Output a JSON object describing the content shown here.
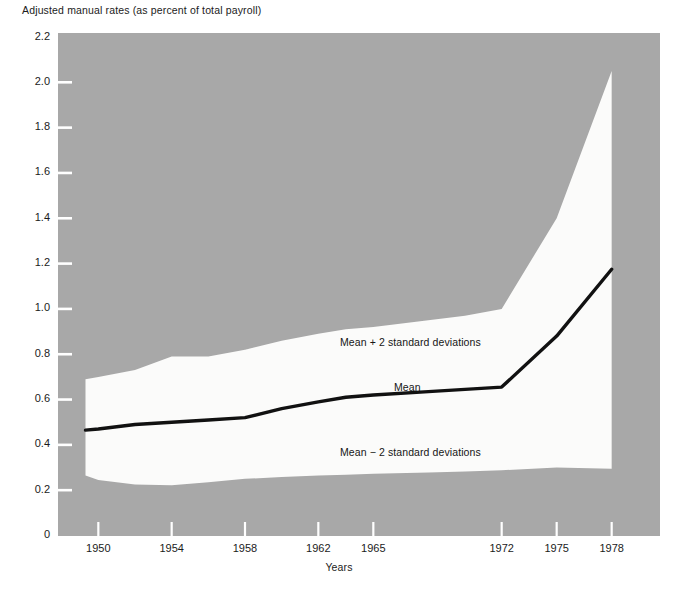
{
  "figure": {
    "title": "Adjusted manual rates (as percent of total payroll)",
    "xaxis_title": "Years",
    "footnote_faint": "",
    "background_color": "#ffffff",
    "band_fill_color": "#fbfbfa",
    "plot_area_color": "#a8a8a8",
    "line_color": "#111111"
  },
  "annotations": {
    "upper": "Mean + 2 standard deviations",
    "mean": "Mean",
    "lower": "Mean − 2 standard deviations"
  },
  "yticks": [
    "2.2",
    "2.0",
    "1.8",
    "1.6",
    "1.4",
    "1.2",
    "1.0",
    "0.8",
    "0.6",
    "0.4",
    "0.2",
    "0"
  ],
  "xticks": [
    "1950",
    "1954",
    "1958",
    "1962",
    "1965",
    "1972",
    "1975",
    "1978"
  ],
  "chart_data": {
    "type": "area",
    "title": "Adjusted manual rates (as percent of total payroll)",
    "xlabel": "Years",
    "ylabel": "Adjusted manual rates (as percent of total payroll)",
    "xlim": [
      1949,
      1979
    ],
    "ylim": [
      0,
      2.2
    ],
    "ytick_values": [
      2.2,
      2.0,
      1.8,
      1.6,
      1.4,
      1.2,
      1.0,
      0.8,
      0.6,
      0.4,
      0.2,
      0
    ],
    "xtick_values": [
      1950,
      1954,
      1958,
      1962,
      1965,
      1972,
      1975,
      1978
    ],
    "grid": false,
    "legend": "inline annotations",
    "x": [
      1949.3,
      1950,
      1952,
      1954,
      1956,
      1958,
      1960,
      1962,
      1963.5,
      1965,
      1968,
      1970,
      1972,
      1975,
      1978
    ],
    "series": [
      {
        "name": "Mean + 2 standard deviations",
        "values": [
          0.69,
          0.7,
          0.73,
          0.79,
          0.79,
          0.82,
          0.86,
          0.89,
          0.91,
          0.92,
          0.95,
          0.97,
          1.0,
          1.4,
          2.05
        ]
      },
      {
        "name": "Mean",
        "values": [
          0.465,
          0.47,
          0.49,
          0.5,
          0.51,
          0.52,
          0.56,
          0.59,
          0.61,
          0.62,
          0.635,
          0.645,
          0.655,
          0.88,
          1.175
        ]
      },
      {
        "name": "Mean − 2 standard deviations",
        "values": [
          0.265,
          0.245,
          0.225,
          0.222,
          0.235,
          0.25,
          0.258,
          0.265,
          0.268,
          0.272,
          0.278,
          0.282,
          0.288,
          0.3,
          0.295
        ]
      }
    ]
  }
}
